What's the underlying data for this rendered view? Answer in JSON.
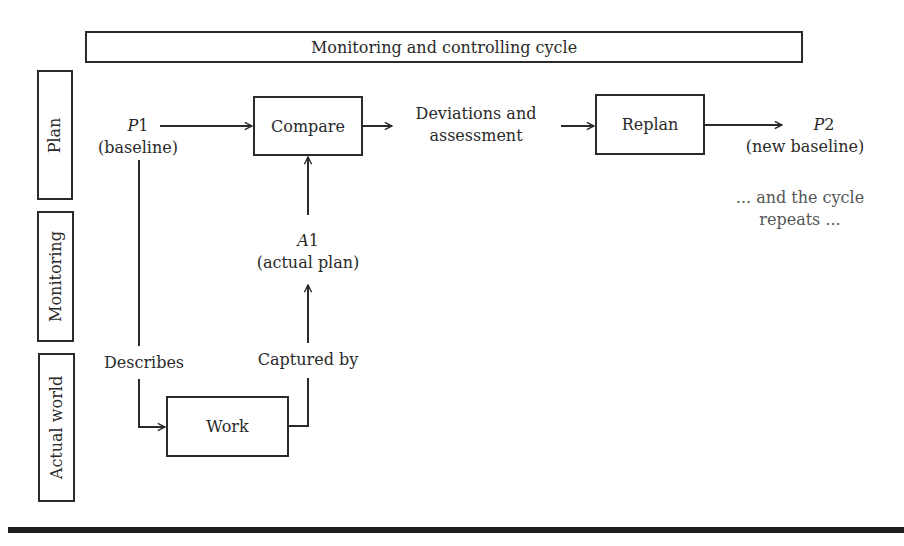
{
  "diagram": {
    "title": "Monitoring and controlling cycle",
    "lanes": [
      {
        "id": "plan",
        "label": "Plan"
      },
      {
        "id": "monitoring",
        "label": "Monitoring"
      },
      {
        "id": "actual_world",
        "label": "Actual world"
      }
    ],
    "nodes": {
      "compare": "Compare",
      "replan": "Replan",
      "work": "Work"
    },
    "labels": {
      "p1_symbol": "P",
      "p1_index": "1",
      "p1_caption": "(baseline)",
      "deviations_line1": "Deviations and",
      "deviations_line2": "assessment",
      "p2_symbol": "P",
      "p2_index": "2",
      "p2_caption": "(new baseline)",
      "a1_symbol": "A",
      "a1_index": "1",
      "a1_caption": "(actual plan)",
      "describes": "Describes",
      "captured_by": "Captured by",
      "repeat_line1": "... and the cycle",
      "repeat_line2": "repeats ..."
    },
    "edges": [
      {
        "from": "P1",
        "to": "Compare"
      },
      {
        "from": "Compare",
        "to": "Deviations and assessment"
      },
      {
        "from": "Deviations and assessment",
        "to": "Replan"
      },
      {
        "from": "Replan",
        "to": "P2"
      },
      {
        "from": "P1",
        "to": "Work",
        "label": "Describes"
      },
      {
        "from": "Work",
        "to": "A1",
        "label": "Captured by"
      },
      {
        "from": "A1",
        "to": "Compare"
      }
    ]
  }
}
